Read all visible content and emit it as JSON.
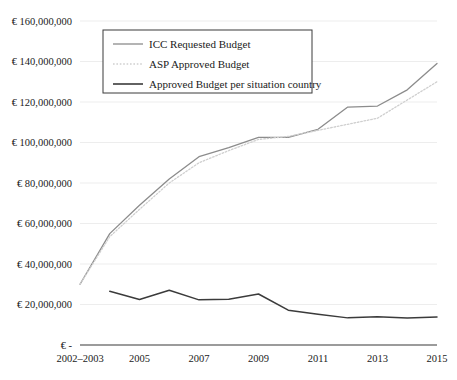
{
  "chart_data": {
    "type": "line",
    "title": "",
    "xlabel": "",
    "ylabel": "",
    "grid": true,
    "legend_position": "top-left-inside",
    "ylim": [
      0,
      160000000
    ],
    "ytick_values": [
      0,
      20000000,
      40000000,
      60000000,
      80000000,
      100000000,
      120000000,
      140000000,
      160000000
    ],
    "ytick_labels": [
      "€ -",
      "€ 20,000,000",
      "€ 40,000,000",
      "€ 60,000,000",
      "€ 80,000,000",
      "€ 100,000,000",
      "€ 120,000,000",
      "€ 140,000,000",
      "€ 160,000,000"
    ],
    "x": [
      "2002–2003",
      "2004",
      "2005",
      "2006",
      "2007",
      "2008",
      "2009",
      "2010",
      "2011",
      "2012",
      "2013",
      "2014",
      "2015"
    ],
    "xtick_labels_shown": [
      "2002–2003",
      "2005",
      "2007",
      "2009",
      "2011",
      "2013",
      "2015"
    ],
    "series": [
      {
        "name": "ICC Requested Budget",
        "color": "#8c8c8c",
        "style": "solid",
        "values": [
          30000000,
          55000000,
          69000000,
          82000000,
          93000000,
          97500000,
          102500000,
          102500000,
          106500000,
          117500000,
          118000000,
          126000000,
          139000000
        ]
      },
      {
        "name": "ASP Approved Budget",
        "color": "#cfcfcf",
        "style": "dotted",
        "values": [
          30000000,
          53500000,
          67000000,
          80000000,
          90000000,
          96000000,
          101500000,
          103000000,
          106000000,
          109000000,
          112000000,
          121000000,
          130000000
        ]
      },
      {
        "name": "Approved Budget per situation country",
        "color": "#3b3b3b",
        "style": "solid",
        "values": [
          null,
          26500000,
          22500000,
          27000000,
          22300000,
          22600000,
          25200000,
          17200000,
          15200000,
          13400000,
          14000000,
          13300000,
          13800000
        ]
      }
    ]
  },
  "legend": {
    "entries": [
      {
        "label": "ICC Requested Budget"
      },
      {
        "label": "ASP Approved Budget"
      },
      {
        "label": "Approved Budget per situation country"
      }
    ]
  }
}
